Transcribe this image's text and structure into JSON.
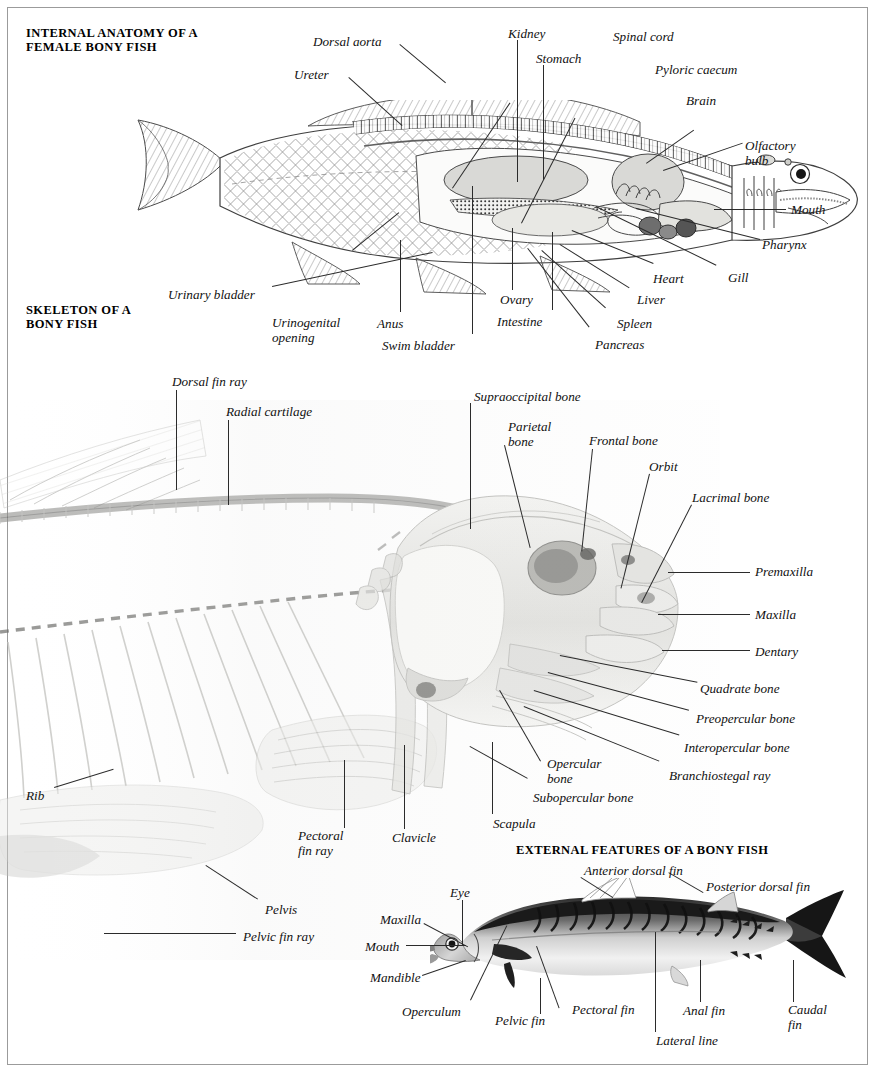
{
  "page": {
    "width": 877,
    "height": 1080,
    "background": "#ffffff",
    "border_color": "#9b9b9b"
  },
  "sections": [
    {
      "id": "internal-anatomy",
      "title": "INTERNAL ANATOMY OF A\nFEMALE BONY FISH",
      "artwork": "line-engraving of a bony fish cut away to show viscera"
    },
    {
      "id": "skeleton",
      "title": "SKELETON OF A\nBONY FISH",
      "artwork": "faded photograph of a bony fish skeleton with skull at right"
    },
    {
      "id": "external-features",
      "title": "EXTERNAL FEATURES OF A BONY FISH",
      "artwork": "black and white photograph of a mackerel in left profile"
    }
  ],
  "internal_labels": [
    {
      "text": "Dorsal aorta",
      "x": 313,
      "y": 35,
      "align": "left"
    },
    {
      "text": "Ureter",
      "x": 294,
      "y": 68,
      "align": "left"
    },
    {
      "text": "Kidney",
      "x": 508,
      "y": 27,
      "align": "left"
    },
    {
      "text": "Stomach",
      "x": 536,
      "y": 52,
      "align": "left"
    },
    {
      "text": "Spinal cord",
      "x": 613,
      "y": 30,
      "align": "left"
    },
    {
      "text": "Pyloric caecum",
      "x": 655,
      "y": 63,
      "align": "left"
    },
    {
      "text": "Brain",
      "x": 686,
      "y": 94,
      "align": "left"
    },
    {
      "text": "Olfactory\nbulb",
      "x": 745,
      "y": 139,
      "align": "left"
    },
    {
      "text": "Mouth",
      "x": 791,
      "y": 203,
      "align": "left"
    },
    {
      "text": "Pharynx",
      "x": 762,
      "y": 238,
      "align": "left"
    },
    {
      "text": "Gill",
      "x": 728,
      "y": 271,
      "align": "left"
    },
    {
      "text": "Heart",
      "x": 653,
      "y": 272,
      "align": "left"
    },
    {
      "text": "Liver",
      "x": 637,
      "y": 293,
      "align": "left"
    },
    {
      "text": "Spleen",
      "x": 617,
      "y": 317,
      "align": "left"
    },
    {
      "text": "Pancreas",
      "x": 595,
      "y": 338,
      "align": "left"
    },
    {
      "text": "Intestine",
      "x": 497,
      "y": 315,
      "align": "left"
    },
    {
      "text": "Ovary",
      "x": 500,
      "y": 293,
      "align": "left"
    },
    {
      "text": "Swim bladder",
      "x": 382,
      "y": 339,
      "align": "left"
    },
    {
      "text": "Anus",
      "x": 377,
      "y": 317,
      "align": "left"
    },
    {
      "text": "Urinogenital\nopening",
      "x": 272,
      "y": 316,
      "align": "left"
    },
    {
      "text": "Urinary bladder",
      "x": 168,
      "y": 288,
      "align": "left"
    }
  ],
  "skeleton_labels": [
    {
      "text": "Dorsal fin ray",
      "x": 172,
      "y": 375,
      "align": "left"
    },
    {
      "text": "Radial cartilage",
      "x": 226,
      "y": 405,
      "align": "left"
    },
    {
      "text": "Supraoccipital bone",
      "x": 474,
      "y": 390,
      "align": "left"
    },
    {
      "text": "Parietal\nbone",
      "x": 508,
      "y": 420,
      "align": "left"
    },
    {
      "text": "Frontal bone",
      "x": 589,
      "y": 434,
      "align": "left"
    },
    {
      "text": "Orbit",
      "x": 649,
      "y": 460,
      "align": "left"
    },
    {
      "text": "Lacrimal bone",
      "x": 692,
      "y": 491,
      "align": "left"
    },
    {
      "text": "Premaxilla",
      "x": 755,
      "y": 565,
      "align": "left"
    },
    {
      "text": "Maxilla",
      "x": 755,
      "y": 608,
      "align": "left"
    },
    {
      "text": "Dentary",
      "x": 755,
      "y": 645,
      "align": "left"
    },
    {
      "text": "Quadrate bone",
      "x": 700,
      "y": 682,
      "align": "left"
    },
    {
      "text": "Preopercular bone",
      "x": 696,
      "y": 712,
      "align": "left"
    },
    {
      "text": "Interopercular bone",
      "x": 684,
      "y": 741,
      "align": "left"
    },
    {
      "text": "Branchiostegal ray",
      "x": 669,
      "y": 769,
      "align": "left"
    },
    {
      "text": "Opercular\nbone",
      "x": 547,
      "y": 757,
      "align": "left"
    },
    {
      "text": "Subopercular bone",
      "x": 533,
      "y": 791,
      "align": "left"
    },
    {
      "text": "Scapula",
      "x": 493,
      "y": 817,
      "align": "left"
    },
    {
      "text": "Clavicle",
      "x": 392,
      "y": 831,
      "align": "left"
    },
    {
      "text": "Pectoral\nfin ray",
      "x": 298,
      "y": 829,
      "align": "left"
    },
    {
      "text": "Rib",
      "x": 26,
      "y": 789,
      "align": "left"
    },
    {
      "text": "Pelvis",
      "x": 265,
      "y": 903,
      "align": "left"
    },
    {
      "text": "Pelvic fin ray",
      "x": 243,
      "y": 930,
      "align": "left"
    }
  ],
  "external_labels": [
    {
      "text": "Anterior dorsal fin",
      "x": 584,
      "y": 864,
      "align": "left"
    },
    {
      "text": "Posterior dorsal fin",
      "x": 706,
      "y": 880,
      "align": "left"
    },
    {
      "text": "Eye",
      "x": 450,
      "y": 886,
      "align": "left"
    },
    {
      "text": "Maxilla",
      "x": 380,
      "y": 913,
      "align": "left"
    },
    {
      "text": "Mouth",
      "x": 365,
      "y": 940,
      "align": "left"
    },
    {
      "text": "Mandible",
      "x": 370,
      "y": 971,
      "align": "left"
    },
    {
      "text": "Operculum",
      "x": 402,
      "y": 1005,
      "align": "left"
    },
    {
      "text": "Pelvic fin",
      "x": 495,
      "y": 1014,
      "align": "left"
    },
    {
      "text": "Pectoral fin",
      "x": 572,
      "y": 1003,
      "align": "left"
    },
    {
      "text": "Anal fin",
      "x": 683,
      "y": 1004,
      "align": "left"
    },
    {
      "text": "Lateral line",
      "x": 656,
      "y": 1034,
      "align": "left"
    },
    {
      "text": "Caudal\nfin",
      "x": 788,
      "y": 1003,
      "align": "left"
    }
  ],
  "colors": {
    "text": "#111111",
    "leader": "#2b2b2b",
    "organ_fill": "#d9d9d6",
    "organ_fill_light": "#e8e8e4",
    "organ_dark": "#6e6e6e",
    "photo_dark": "#1d1d1d",
    "photo_mid": "#8a8a8a",
    "photo_pale": "#e4e4e2"
  }
}
